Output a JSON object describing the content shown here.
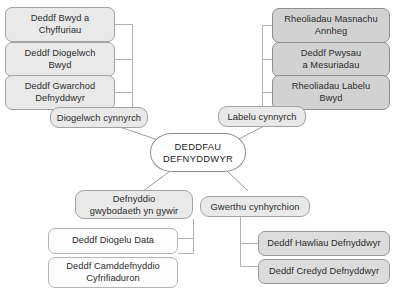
{
  "diagram": {
    "title": "DEDDFAU DEFNYDDWYR",
    "language": "cy",
    "type": "mind-map",
    "center": {
      "label": "DEDDFAU\nDEFNYDDWYR"
    },
    "branches": [
      {
        "id": "diogelwch-cynnyrch",
        "hub_label": "Diogelwch cynnyrch",
        "position": "top-left",
        "children": [
          {
            "label": "Deddf Bwyd a\nChyffuriau"
          },
          {
            "label": "Deddf Diogelwch\nBwyd"
          },
          {
            "label": "Deddf Gwarchod\nDefnyddwyr"
          }
        ]
      },
      {
        "id": "labelu-cynnyrch",
        "hub_label": "Labelu cynnyrch",
        "position": "top-right",
        "children": [
          {
            "label": "Rheoliadau Masnachu\nAnnheg"
          },
          {
            "label": "Deddf Pwysau\na Mesuriadau"
          },
          {
            "label": "Rheoliadau Labelu\nBwyd"
          }
        ]
      },
      {
        "id": "defnyddio-gwybodaeth",
        "hub_label": "Defnyddio\ngwybodaeth yn gywir",
        "position": "bottom-left",
        "children": [
          {
            "label": "Deddf Diogelu Data"
          },
          {
            "label": "Deddf Camddefnyddio\nCyfrifiaduron"
          }
        ]
      },
      {
        "id": "gwerthu-cynhyrchion",
        "hub_label": "Gwerthu cynhyrchion",
        "position": "bottom-right",
        "children": [
          {
            "label": "Deddf Hawliau Defnyddwyr"
          },
          {
            "label": "Deddf Credyd Defnyddwyr"
          }
        ]
      }
    ],
    "colors": {
      "background": "#ffffff",
      "node_light": "#e9e9e9",
      "node_medium": "#d2d2d2",
      "node_white": "#fdfdfd",
      "border": "#9a9a9a",
      "connector": "#b0b0b0",
      "text": "#2b2b2b"
    }
  }
}
